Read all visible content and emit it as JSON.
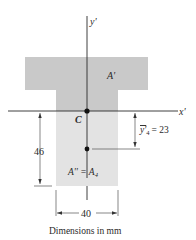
{
  "diagram": {
    "type": "T-section cross-section with centroid and axes",
    "axes": {
      "y_axis_label": "y'",
      "x_axis_label": "x'"
    },
    "labels": {
      "upper_area": "A'",
      "centroid": "C",
      "lower_area": "A'' = A",
      "lower_area_subscript": "4",
      "ybar_label": "y'",
      "ybar_subscript": "4",
      "ybar_value": "= 23",
      "height_dim": "46",
      "width_dim": "40",
      "caption": "Dimensions in mm"
    },
    "colors": {
      "upper_fill": "#c9c9c9",
      "lower_fill": "#e3e3e3",
      "line": "#2a2a2a",
      "dim_line": "#555555"
    }
  }
}
